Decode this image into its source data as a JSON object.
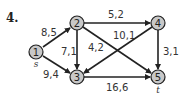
{
  "problem": {
    "number": "4."
  },
  "graph": {
    "nodes": [
      {
        "id": "1",
        "label": "1",
        "sub": "s",
        "x": 36,
        "y": 52
      },
      {
        "id": "2",
        "label": "2",
        "sub": "",
        "x": 77,
        "y": 23
      },
      {
        "id": "3",
        "label": "3",
        "sub": "",
        "x": 77,
        "y": 77
      },
      {
        "id": "4",
        "label": "4",
        "sub": "",
        "x": 158,
        "y": 23
      },
      {
        "id": "5",
        "label": "5",
        "sub": "t",
        "x": 158,
        "y": 77
      }
    ],
    "edges": [
      {
        "from": "1",
        "to": "2",
        "label": "8,5"
      },
      {
        "from": "1",
        "to": "3",
        "label": "9,4"
      },
      {
        "from": "2",
        "to": "3",
        "label": "7,1"
      },
      {
        "from": "2",
        "to": "4",
        "label": "5,2"
      },
      {
        "from": "2",
        "to": "5",
        "label": "10,1"
      },
      {
        "from": "4",
        "to": "3",
        "label": "4,2"
      },
      {
        "from": "4",
        "to": "5",
        "label": "3,1"
      },
      {
        "from": "3",
        "to": "5",
        "label": "16,6"
      }
    ],
    "colors": {
      "node_fill": "#c8c8c8",
      "stroke": "#222222"
    }
  }
}
